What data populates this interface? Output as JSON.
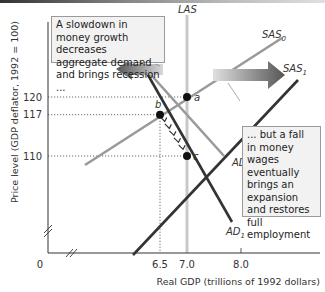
{
  "chart_data": {
    "type": "line",
    "title": "",
    "xlabel": "Real GDP (trillions of 1992 dollars)",
    "ylabel": "Price level (GDP deflator, 1992 = 100)",
    "x_ticks": [
      "0",
      "6.5",
      "7.0",
      "8.0"
    ],
    "y_ticks": [
      "120",
      "117",
      "110"
    ],
    "xlim": [
      5.0,
      8.5
    ],
    "ylim": [
      93,
      130
    ],
    "grid": false,
    "series": [
      {
        "name": "LAS",
        "label": "LAS",
        "color": "#c8c8c8",
        "points": [
          [
            7.0,
            93
          ],
          [
            7.0,
            133
          ]
        ]
      },
      {
        "name": "SAS0",
        "label": "SAS",
        "sub": "0",
        "color": "#9a9a9a",
        "points": [
          [
            5.75,
            108.5
          ],
          [
            9.5,
            130
          ]
        ]
      },
      {
        "name": "SAS1",
        "label": "SAS",
        "sub": "1",
        "color": "#333333",
        "points": [
          [
            6.7,
            93
          ],
          [
            9.8,
            122.5
          ]
        ]
      },
      {
        "name": "AD0",
        "label": "AD",
        "sub": "0",
        "color": "#9a9a9a",
        "points": [
          [
            6.3,
            125
          ],
          [
            7.7,
            110
          ]
        ]
      },
      {
        "name": "AD1",
        "label": "AD",
        "sub": "1",
        "color": "#333333",
        "points": [
          [
            6.0,
            129.5
          ],
          [
            8.0,
            98.5
          ]
        ]
      }
    ],
    "points": [
      {
        "label": "a",
        "x": 7.0,
        "y": 120
      },
      {
        "label": "b",
        "x": 6.5,
        "y": 117
      },
      {
        "label": "c",
        "x": 7.0,
        "y": 110
      }
    ],
    "annotations": [
      "A slowdown in money growth decreases aggregate demand and brings recession ...",
      "... but a fall in money wages eventually brings an expansion and restores full employment"
    ]
  },
  "notes": {
    "left": "A slowdown in money growth decreases aggregate demand and brings recession ...",
    "right": "... but a fall in money wages eventually brings an expansion and restores full employment"
  }
}
